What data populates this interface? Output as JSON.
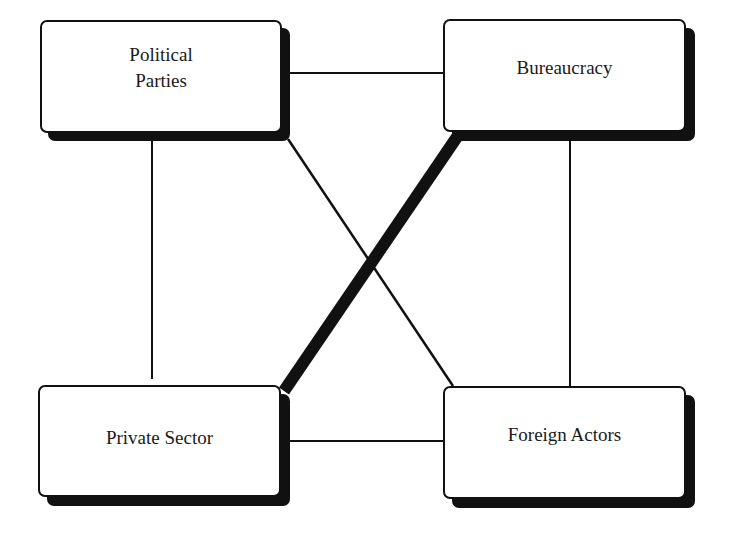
{
  "diagram": {
    "nodes": [
      {
        "id": "political-parties",
        "label": "Political\nParties"
      },
      {
        "id": "bureaucracy",
        "label": "Bureaucracy"
      },
      {
        "id": "private-sector",
        "label": "Private Sector"
      },
      {
        "id": "foreign-actors",
        "label": "Foreign Actors"
      }
    ],
    "edges": [
      {
        "from": "political-parties",
        "to": "bureaucracy",
        "weight": "thin"
      },
      {
        "from": "political-parties",
        "to": "private-sector",
        "weight": "thin"
      },
      {
        "from": "political-parties",
        "to": "foreign-actors",
        "weight": "thin"
      },
      {
        "from": "bureaucracy",
        "to": "foreign-actors",
        "weight": "thin"
      },
      {
        "from": "bureaucracy",
        "to": "private-sector",
        "weight": "thick"
      },
      {
        "from": "private-sector",
        "to": "foreign-actors",
        "weight": "thin"
      }
    ],
    "colors": {
      "stroke": "#111111",
      "fill": "#ffffff",
      "text": "#1a1a1a"
    }
  }
}
